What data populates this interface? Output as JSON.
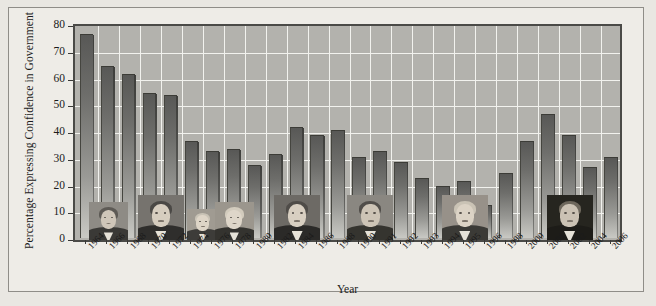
{
  "chart_data": {
    "type": "bar",
    "title": "",
    "xlabel": "Year",
    "ylabel": "Percentage Expressing Confidence in Government",
    "ylim": [
      0,
      80
    ],
    "yticks": [
      0,
      10,
      20,
      30,
      40,
      50,
      60,
      70,
      80
    ],
    "grid": true,
    "legend": "none",
    "categories": [
      "1964",
      "1966",
      "1968",
      "1970",
      "1972",
      "1974",
      "1976",
      "1978",
      "1980",
      "1982",
      "1984",
      "1986",
      "1988",
      "1990",
      "1991",
      "1992",
      "1993",
      "1994",
      "1995",
      "1996",
      "1998",
      "2000",
      "2001",
      "2002",
      "2004",
      "2006"
    ],
    "values": [
      76,
      64,
      61,
      54,
      53,
      36,
      32,
      33,
      27,
      31,
      41,
      38,
      40,
      30,
      32,
      28,
      22,
      19,
      21,
      12,
      24,
      36,
      46,
      38,
      26,
      30
    ],
    "series": [
      {
        "name": "Percentage Expressing Confidence in Government",
        "values": [
          76,
          64,
          61,
          54,
          53,
          36,
          32,
          33,
          27,
          31,
          41,
          38,
          40,
          30,
          32,
          28,
          22,
          19,
          21,
          12,
          24,
          36,
          46,
          38,
          26,
          30
        ]
      }
    ],
    "annotations": [
      {
        "name": "lyndon-johnson",
        "label": "Lyndon B. Johnson",
        "span": [
          "1964",
          "1968"
        ]
      },
      {
        "name": "richard-nixon",
        "label": "Richard Nixon",
        "span": [
          "1968",
          "1974"
        ]
      },
      {
        "name": "gerald-ford",
        "label": "Gerald Ford",
        "span": [
          "1974",
          "1976"
        ]
      },
      {
        "name": "jimmy-carter",
        "label": "Jimmy Carter",
        "span": [
          "1976",
          "1980"
        ]
      },
      {
        "name": "ronald-reagan",
        "label": "Ronald Reagan",
        "span": [
          "1980",
          "1988"
        ]
      },
      {
        "name": "george-h-w-bush",
        "label": "George H. W. Bush",
        "span": [
          "1988",
          "1992"
        ]
      },
      {
        "name": "bill-clinton",
        "label": "Bill Clinton",
        "span": [
          "1992",
          "2000"
        ]
      },
      {
        "name": "george-w-bush",
        "label": "George W. Bush",
        "span": [
          "2000",
          "2006"
        ]
      }
    ]
  },
  "colors": {
    "page_background": "#e9e7e2",
    "figure_background": "#eeece7",
    "plot_background": "#b3b2ad",
    "gridline": "#f2f2ee",
    "bar_dark": "#585856",
    "bar_light": "#c9c9c4",
    "axis": "#3a3a38",
    "text": "#1b1b1b"
  }
}
